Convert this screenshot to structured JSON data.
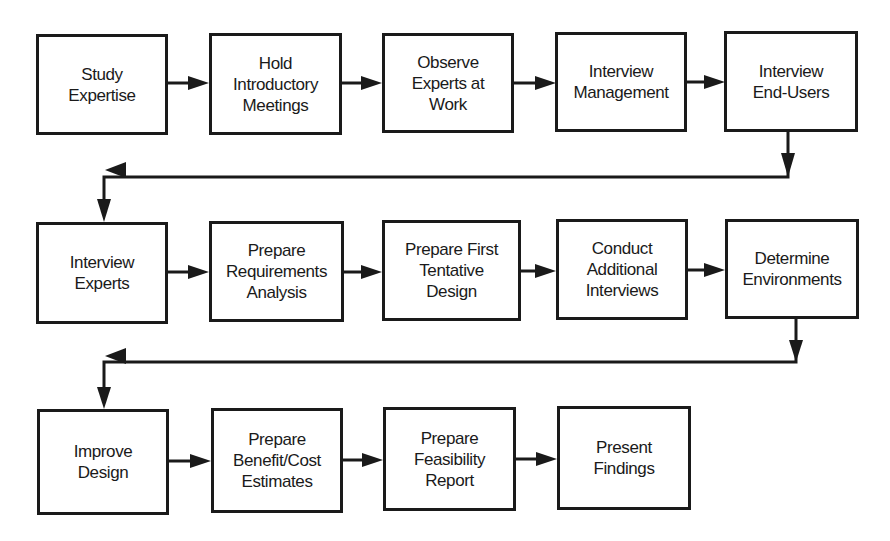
{
  "diagram": {
    "type": "flowchart",
    "colors": {
      "stroke": "#1a1a1a",
      "background": "#ffffff"
    },
    "rows": [
      {
        "steps": [
          {
            "id": "s1",
            "label": "Study\nExpertise"
          },
          {
            "id": "s2",
            "label": "Hold\nIntroductory\nMeetings"
          },
          {
            "id": "s3",
            "label": "Observe\nExperts at\nWork"
          },
          {
            "id": "s4",
            "label": "Interview\nManagement"
          },
          {
            "id": "s5",
            "label": "Interview\nEnd-Users"
          }
        ]
      },
      {
        "steps": [
          {
            "id": "s6",
            "label": "Interview\nExperts"
          },
          {
            "id": "s7",
            "label": "Prepare\nRequirements\nAnalysis"
          },
          {
            "id": "s8",
            "label": "Prepare First\nTentative\nDesign"
          },
          {
            "id": "s9",
            "label": "Conduct\nAdditional\nInterviews"
          },
          {
            "id": "s10",
            "label": "Determine\nEnvironments"
          }
        ]
      },
      {
        "steps": [
          {
            "id": "s11",
            "label": "Improve\nDesign"
          },
          {
            "id": "s12",
            "label": "Prepare\nBenefit/Cost\nEstimates"
          },
          {
            "id": "s13",
            "label": "Prepare\nFeasibility\nReport"
          },
          {
            "id": "s14",
            "label": "Present\nFindings"
          }
        ]
      }
    ],
    "edges": [
      [
        "s1",
        "s2"
      ],
      [
        "s2",
        "s3"
      ],
      [
        "s3",
        "s4"
      ],
      [
        "s4",
        "s5"
      ],
      [
        "s5",
        "s6"
      ],
      [
        "s6",
        "s7"
      ],
      [
        "s7",
        "s8"
      ],
      [
        "s8",
        "s9"
      ],
      [
        "s9",
        "s10"
      ],
      [
        "s10",
        "s11"
      ],
      [
        "s11",
        "s12"
      ],
      [
        "s12",
        "s13"
      ],
      [
        "s13",
        "s14"
      ]
    ]
  }
}
